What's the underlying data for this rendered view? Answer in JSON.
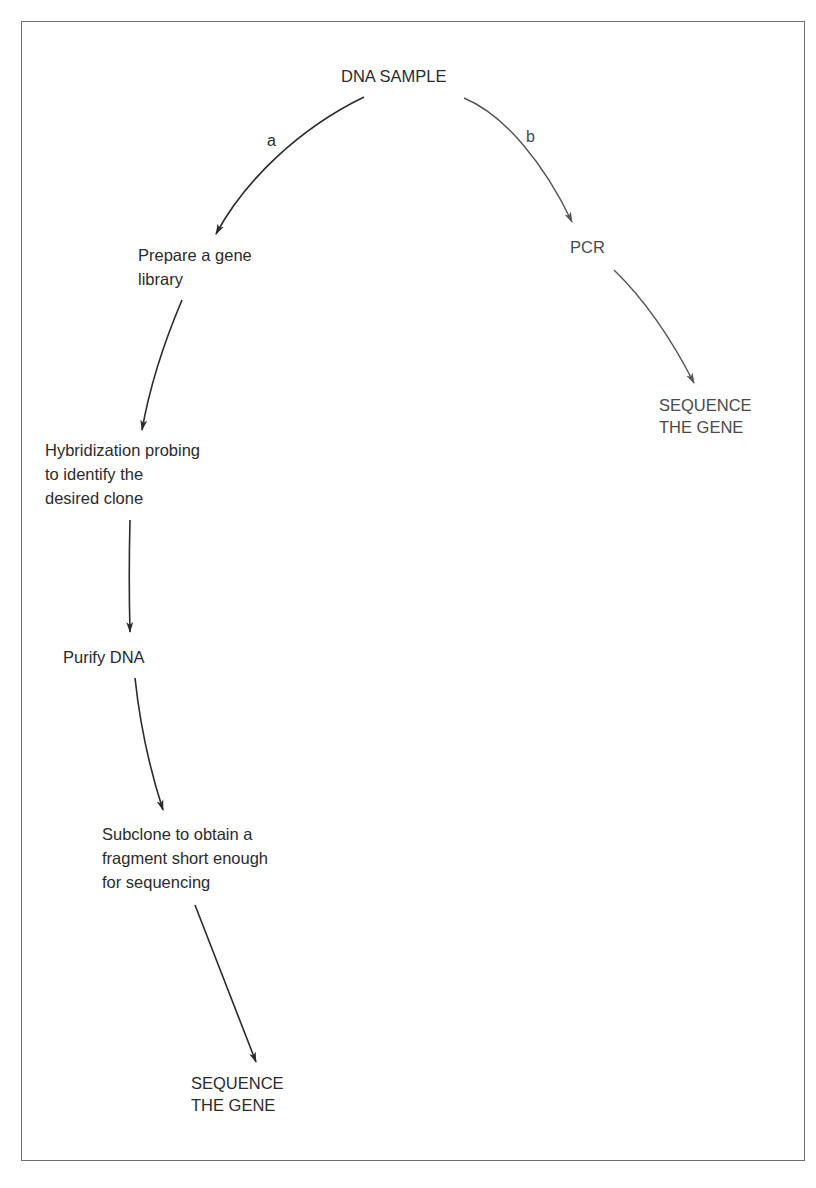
{
  "diagram": {
    "root": {
      "label": "DNA SAMPLE"
    },
    "branches": [
      {
        "label": "a",
        "steps": [
          {
            "lines": [
              "Prepare a gene",
              "library"
            ]
          },
          {
            "lines": [
              "Hybridization probing",
              "to identify the",
              "desired clone"
            ]
          },
          {
            "lines": [
              "Purify DNA"
            ]
          },
          {
            "lines": [
              "Subclone to obtain a",
              "fragment short enough",
              "for sequencing"
            ]
          },
          {
            "lines": [
              "SEQUENCE",
              "THE GENE"
            ]
          }
        ]
      },
      {
        "label": "b",
        "steps": [
          {
            "lines": [
              "PCR"
            ]
          },
          {
            "lines": [
              "SEQUENCE",
              "THE GENE"
            ]
          }
        ]
      }
    ],
    "colors": {
      "branch_a": "#2b2b2b",
      "branch_b": "#555555",
      "frame": "#6e6e6e"
    }
  }
}
